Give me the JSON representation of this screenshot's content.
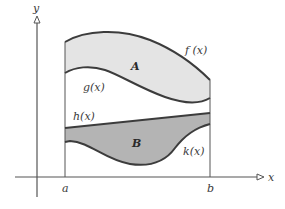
{
  "diagram": {
    "type": "area-between-curves",
    "axes": {
      "x_label": "x",
      "y_label": "y"
    },
    "bounds": {
      "left": "a",
      "right": "b"
    },
    "curves": {
      "f": "f (x)",
      "g": "g(x)",
      "h": "h(x)",
      "k": "k(x)"
    },
    "regions": {
      "upper": "A",
      "lower": "B"
    },
    "colors": {
      "region_A_fill": "#e4e4e4",
      "region_B_fill": "#b4b4b4",
      "curve_stroke": "#3c3c3c",
      "axis_stroke": "#555555"
    }
  }
}
